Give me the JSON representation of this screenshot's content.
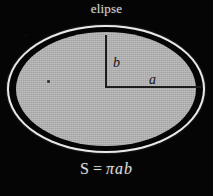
{
  "figure": {
    "title": "elipse",
    "kind": "ellipse-area-diagram",
    "background_color": "#050505",
    "fill_color": "#b3b3b3",
    "outline_color": "#050505",
    "ring_color": "#e9e9e9",
    "text_color": "#dcdcdc",
    "label_color": "#151515"
  },
  "labels": {
    "semi_minor_axis": "b",
    "semi_major_axis": "a",
    "center_point": "center-dot"
  },
  "formula": {
    "left_side": "S",
    "equals": "=",
    "right_side": "πab",
    "full": "S = πab"
  }
}
